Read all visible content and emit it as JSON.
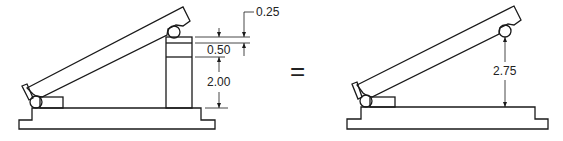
{
  "figure": {
    "left_setup": {
      "dimensions": [
        {
          "id": "gauge-block-top",
          "label": "0.25"
        },
        {
          "id": "gauge-block-mid",
          "label": "0.50"
        },
        {
          "id": "gauge-block-base",
          "label": "2.00"
        }
      ]
    },
    "equals_sign": "=",
    "right_setup": {
      "dimensions": [
        {
          "id": "total-height",
          "label": "2.75"
        }
      ]
    }
  }
}
